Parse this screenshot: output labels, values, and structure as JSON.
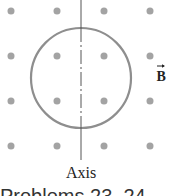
{
  "diagram": {
    "field_symbol": "B",
    "field_direction": "out-of-page (dots)",
    "axis_label": "Axis",
    "caption": "Problems 23, 24",
    "colors": {
      "dot": "#a0a0a0",
      "loop": "#8c8c8c",
      "axis": "#555555",
      "text": "#222222"
    },
    "dot_grid": {
      "columns_x": [
        11,
        57,
        104,
        150
      ],
      "rows_y": [
        11,
        56,
        101,
        146
      ],
      "radius": 3.5
    },
    "loop": {
      "cx": 81,
      "cy": 78,
      "r": 50
    }
  }
}
